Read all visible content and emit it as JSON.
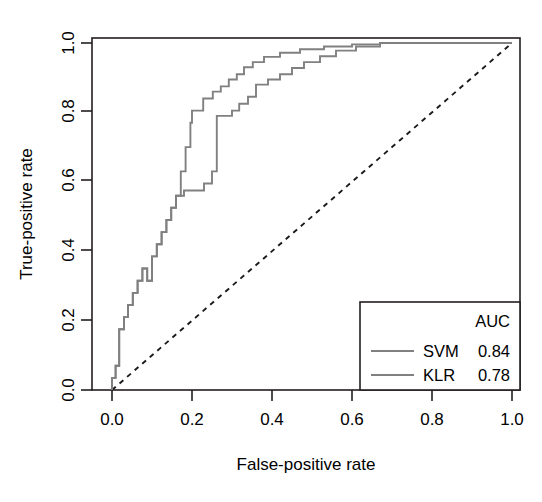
{
  "chart_data": {
    "type": "line",
    "title": "",
    "xlabel": "False-positive rate",
    "ylabel": "True-positive rate",
    "xlim": [
      -0.04,
      1.04
    ],
    "ylim": [
      -0.04,
      1.04
    ],
    "xticks": [
      "0.0",
      "0.2",
      "0.4",
      "0.6",
      "0.8",
      "1.0"
    ],
    "xtick_values": [
      0.0,
      0.2,
      0.4,
      0.6,
      0.8,
      1.0
    ],
    "yticks": [
      "0.0",
      "0.2",
      "0.4",
      "0.6",
      "0.8",
      "1.0"
    ],
    "ytick_values": [
      0.0,
      0.2,
      0.4,
      0.6,
      0.8,
      1.0
    ],
    "grid": false,
    "legend_position": "bottom-right",
    "legend_title": "AUC",
    "series": [
      {
        "name": "SVM",
        "auc": "0.84",
        "color": "#808080",
        "style": "step",
        "points": [
          [
            0.0,
            0.0
          ],
          [
            0.0,
            0.035
          ],
          [
            0.009,
            0.035
          ],
          [
            0.009,
            0.07
          ],
          [
            0.018,
            0.07
          ],
          [
            0.018,
            0.105
          ],
          [
            0.018,
            0.175
          ],
          [
            0.03,
            0.175
          ],
          [
            0.03,
            0.21
          ],
          [
            0.04,
            0.21
          ],
          [
            0.04,
            0.245
          ],
          [
            0.052,
            0.245
          ],
          [
            0.052,
            0.28
          ],
          [
            0.064,
            0.28
          ],
          [
            0.064,
            0.315
          ],
          [
            0.076,
            0.315
          ],
          [
            0.076,
            0.35
          ],
          [
            0.088,
            0.35
          ],
          [
            0.088,
            0.315
          ],
          [
            0.1,
            0.315
          ],
          [
            0.1,
            0.385
          ],
          [
            0.112,
            0.385
          ],
          [
            0.112,
            0.42
          ],
          [
            0.124,
            0.42
          ],
          [
            0.124,
            0.455
          ],
          [
            0.136,
            0.455
          ],
          [
            0.136,
            0.49
          ],
          [
            0.148,
            0.49
          ],
          [
            0.148,
            0.525
          ],
          [
            0.16,
            0.525
          ],
          [
            0.16,
            0.56
          ],
          [
            0.172,
            0.56
          ],
          [
            0.172,
            0.63
          ],
          [
            0.184,
            0.63
          ],
          [
            0.184,
            0.7
          ],
          [
            0.196,
            0.7
          ],
          [
            0.196,
            0.77
          ],
          [
            0.2,
            0.77
          ],
          [
            0.2,
            0.805
          ],
          [
            0.228,
            0.805
          ],
          [
            0.228,
            0.84
          ],
          [
            0.252,
            0.84
          ],
          [
            0.252,
            0.86
          ],
          [
            0.272,
            0.86
          ],
          [
            0.272,
            0.875
          ],
          [
            0.292,
            0.875
          ],
          [
            0.292,
            0.895
          ],
          [
            0.312,
            0.895
          ],
          [
            0.312,
            0.91
          ],
          [
            0.33,
            0.91
          ],
          [
            0.33,
            0.93
          ],
          [
            0.352,
            0.93
          ],
          [
            0.352,
            0.945
          ],
          [
            0.38,
            0.945
          ],
          [
            0.38,
            0.96
          ],
          [
            0.42,
            0.96
          ],
          [
            0.42,
            0.972
          ],
          [
            0.47,
            0.972
          ],
          [
            0.47,
            0.982
          ],
          [
            0.53,
            0.982
          ],
          [
            0.53,
            0.99
          ],
          [
            0.6,
            0.99
          ],
          [
            0.6,
            0.996
          ],
          [
            0.67,
            0.996
          ],
          [
            0.67,
            1.0
          ],
          [
            1.0,
            1.0
          ]
        ]
      },
      {
        "name": "KLR",
        "auc": "0.78",
        "color": "#808080",
        "style": "step",
        "points": [
          [
            0.0,
            0.0
          ],
          [
            0.0,
            0.035
          ],
          [
            0.009,
            0.035
          ],
          [
            0.009,
            0.07
          ],
          [
            0.018,
            0.07
          ],
          [
            0.018,
            0.105
          ],
          [
            0.018,
            0.175
          ],
          [
            0.03,
            0.175
          ],
          [
            0.03,
            0.21
          ],
          [
            0.04,
            0.21
          ],
          [
            0.04,
            0.245
          ],
          [
            0.052,
            0.245
          ],
          [
            0.052,
            0.28
          ],
          [
            0.064,
            0.28
          ],
          [
            0.064,
            0.315
          ],
          [
            0.076,
            0.315
          ],
          [
            0.076,
            0.35
          ],
          [
            0.088,
            0.35
          ],
          [
            0.088,
            0.315
          ],
          [
            0.1,
            0.315
          ],
          [
            0.1,
            0.385
          ],
          [
            0.112,
            0.385
          ],
          [
            0.112,
            0.42
          ],
          [
            0.124,
            0.42
          ],
          [
            0.124,
            0.455
          ],
          [
            0.136,
            0.455
          ],
          [
            0.136,
            0.49
          ],
          [
            0.148,
            0.49
          ],
          [
            0.148,
            0.525
          ],
          [
            0.16,
            0.525
          ],
          [
            0.16,
            0.56
          ],
          [
            0.18,
            0.56
          ],
          [
            0.18,
            0.575
          ],
          [
            0.23,
            0.575
          ],
          [
            0.23,
            0.595
          ],
          [
            0.25,
            0.595
          ],
          [
            0.25,
            0.63
          ],
          [
            0.262,
            0.63
          ],
          [
            0.262,
            0.7
          ],
          [
            0.262,
            0.77
          ],
          [
            0.262,
            0.79
          ],
          [
            0.3,
            0.79
          ],
          [
            0.3,
            0.805
          ],
          [
            0.318,
            0.805
          ],
          [
            0.318,
            0.825
          ],
          [
            0.34,
            0.825
          ],
          [
            0.34,
            0.845
          ],
          [
            0.36,
            0.845
          ],
          [
            0.36,
            0.88
          ],
          [
            0.39,
            0.88
          ],
          [
            0.39,
            0.895
          ],
          [
            0.42,
            0.895
          ],
          [
            0.42,
            0.91
          ],
          [
            0.45,
            0.91
          ],
          [
            0.45,
            0.928
          ],
          [
            0.48,
            0.928
          ],
          [
            0.48,
            0.945
          ],
          [
            0.52,
            0.945
          ],
          [
            0.52,
            0.962
          ],
          [
            0.56,
            0.962
          ],
          [
            0.56,
            0.978
          ],
          [
            0.61,
            0.978
          ],
          [
            0.61,
            0.99
          ],
          [
            0.67,
            0.99
          ],
          [
            0.67,
            1.0
          ],
          [
            1.0,
            1.0
          ]
        ]
      }
    ],
    "reference_line": {
      "name": "chance-diagonal",
      "style": "dashed",
      "color": "#1a1a1a",
      "points": [
        [
          0.0,
          0.0
        ],
        [
          1.0,
          1.0
        ]
      ]
    }
  },
  "legend": {
    "header": "AUC",
    "entries": [
      {
        "label": "SVM",
        "value": "0.84"
      },
      {
        "label": "KLR",
        "value": "0.78"
      }
    ]
  },
  "axes": {
    "x_title": "False-positive rate",
    "y_title": "True-positive rate"
  }
}
